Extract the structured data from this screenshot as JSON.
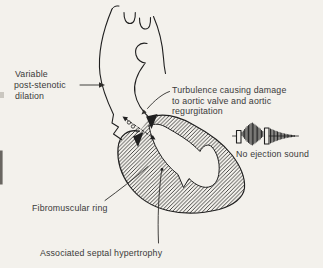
{
  "figure": {
    "background_color": "#f3f1ec",
    "ink_color": "#1f1f1f",
    "text_color": "#3a3a3a",
    "labels": {
      "post_stenotic": {
        "line1": "Variable",
        "line2": "post-stenotic",
        "line3": "dilation"
      },
      "turbulence": {
        "line1": "Turbulence causing damage",
        "line2": "to aortic valve and aortic",
        "line3": "regurgitation"
      },
      "fibromuscular_ring": "Fibromuscular ring",
      "septal_hypertrophy": "Associated septal hypertrophy",
      "no_ejection_sound": "No ejection sound"
    },
    "icons": {
      "phonocardiogram": {
        "name": "phonocardiogram-icon",
        "parts": [
          "first-heart-sound-bar",
          "systolic-murmur-burst",
          "second-heart-sound-bar",
          "diastolic-decrescendo-murmur"
        ]
      }
    }
  }
}
